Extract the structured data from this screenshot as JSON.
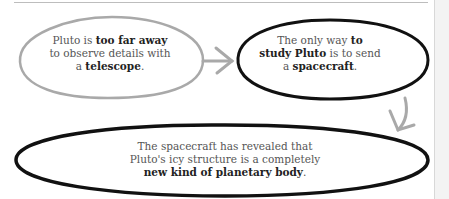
{
  "diagram": {
    "colors": {
      "gray_outline": "#a9a9a9",
      "black_outline": "#111111",
      "arrow": "#a9a9a9",
      "text": "#555555",
      "bold_text": "#222222"
    },
    "nodes": [
      {
        "id": "telescope",
        "outline": "gray",
        "parts": [
          {
            "text": "Pluto is ",
            "bold": false
          },
          {
            "text": "too far away",
            "bold": true
          },
          {
            "text": " to observe details with a ",
            "bold": false
          },
          {
            "text": "telescope",
            "bold": true
          },
          {
            "text": ".",
            "bold": false
          }
        ],
        "lines": [
          "Pluto is too far away",
          "to observe details with",
          "a telescope."
        ]
      },
      {
        "id": "spacecraft",
        "outline": "black",
        "parts": [
          {
            "text": "The only way ",
            "bold": false
          },
          {
            "text": "to study Pluto",
            "bold": true
          },
          {
            "text": " is to send a ",
            "bold": false
          },
          {
            "text": "spacecraft",
            "bold": true
          },
          {
            "text": ".",
            "bold": false
          }
        ],
        "lines": [
          "The only way to",
          "study Pluto is to send",
          "a spacecraft."
        ]
      },
      {
        "id": "new-kind",
        "outline": "black",
        "parts": [
          {
            "text": "The spacecraft has revealed that Pluto's icy structure is a completely ",
            "bold": false
          },
          {
            "text": "new kind of planetary body",
            "bold": true
          },
          {
            "text": ".",
            "bold": false
          }
        ],
        "lines": [
          "The spacecraft has revealed that",
          "Pluto's icy structure is a completely",
          "new kind of planetary body."
        ]
      }
    ],
    "edges": [
      {
        "from": "telescope",
        "to": "spacecraft",
        "direction": "right"
      },
      {
        "from": "spacecraft",
        "to": "new-kind",
        "direction": "down"
      }
    ],
    "n1": {
      "a": "Pluto is ",
      "b": "too far away",
      "c": "to observe details with",
      "d": "a ",
      "e": "telescope",
      "f": "."
    },
    "n2": {
      "a": "The only way ",
      "b": "to",
      "c": "study Pluto",
      "d": " is to send",
      "e": "a ",
      "f": "spacecraft",
      "g": "."
    },
    "n3": {
      "a": "The spacecraft has revealed that",
      "b": "Pluto's icy structure is a completely",
      "c": "new kind of planetary body",
      "d": "."
    }
  }
}
